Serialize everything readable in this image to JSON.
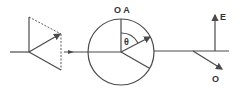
{
  "diagram": {
    "type": "optical polarization schematic",
    "labels": {
      "analyzer_axes": "O A",
      "angle": "θ",
      "extraordinary": "E",
      "ordinary": "O"
    },
    "colors": {
      "line": "#4a4a4a",
      "text": "#333333",
      "background": "#ffffff"
    }
  }
}
